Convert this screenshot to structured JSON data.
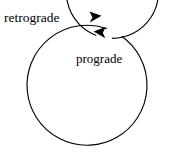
{
  "figure": {
    "title": "Prograde and retrograde orbital motion diagram",
    "background_color": "#ffffff",
    "stroke_color": "#000000",
    "width": 171,
    "height": 162
  },
  "outer_orbit": {
    "label": "retrograde",
    "direction": "clockwise",
    "arrow_points": "right",
    "center_x": 90,
    "center_y": 86,
    "radius": 60,
    "gap_start_deg": -74,
    "gap_end_deg": -58,
    "label_x": 4,
    "label_y": 22,
    "arrow_tip_x": 101,
    "arrow_tip_y": 16
  },
  "inner_orbit": {
    "label": "prograde",
    "direction": "counter-clockwise",
    "arrow_points": "left",
    "center_x": 91,
    "center_y": 81,
    "radius": 46,
    "gap_start_deg": -84,
    "gap_end_deg": -68,
    "label_x": 76,
    "label_y": 63,
    "arrow_tip_x": 94,
    "arrow_tip_y": 32
  },
  "icons": {
    "outer_arrowhead": "arrowhead-right-icon",
    "inner_arrowhead": "arrowhead-left-icon"
  }
}
